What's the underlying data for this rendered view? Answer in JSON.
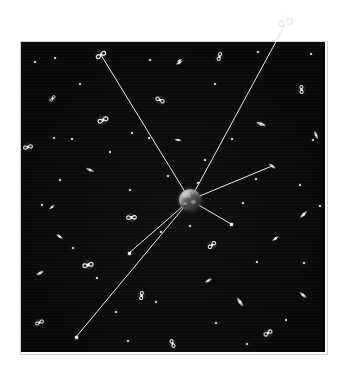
{
  "figure": {
    "title": "",
    "domain": "astronomy-diagram",
    "canvas": {
      "width": 341,
      "height": 367,
      "background": "#ffffff"
    },
    "field": {
      "x": 21,
      "y": 42,
      "width": 304,
      "height": 310,
      "fill": "#090909",
      "border_color": "#d2d2d2"
    }
  },
  "colors": {
    "background": "#ffffff",
    "space": "#090909",
    "sightline": "#e8e8e8",
    "star": "#f2f2f2",
    "galaxy": "#ededed",
    "node": "#fafafa",
    "planet_light": "#c9c9c9",
    "planet_dark": "#171717"
  },
  "observer": {
    "name": "central-planet",
    "cx": 190,
    "cy": 200,
    "diameter": 22
  },
  "sightlines": [
    {
      "name": "sightline-upper-left",
      "x1": 190,
      "y1": 200,
      "x2": 101,
      "y2": 55
    },
    {
      "name": "sightline-upper-right-outer",
      "x1": 190,
      "y1": 200,
      "x2": 285,
      "y2": 25
    },
    {
      "name": "sightline-right",
      "x1": 190,
      "y1": 200,
      "x2": 272,
      "y2": 166
    },
    {
      "name": "sightline-lower-right",
      "x1": 190,
      "y1": 200,
      "x2": 231,
      "y2": 224
    },
    {
      "name": "sightline-lower-left-short",
      "x1": 190,
      "y1": 200,
      "x2": 129,
      "y2": 253
    },
    {
      "name": "sightline-lower-left-long",
      "x1": 190,
      "y1": 200,
      "x2": 76,
      "y2": 337
    }
  ],
  "target_nodes": [
    {
      "name": "node-lower-right",
      "x": 231,
      "y": 224,
      "size": 3
    },
    {
      "name": "node-lower-left-short",
      "x": 129,
      "y": 253,
      "size": 3
    },
    {
      "name": "node-lower-left-long",
      "x": 76,
      "y": 337,
      "size": 3
    }
  ],
  "galaxies": [
    {
      "name": "galaxy-outside-frame-top-right",
      "x": 285,
      "y": 22,
      "size": 19,
      "type": "spiral",
      "rot": 20,
      "outside_field": true
    },
    {
      "name": "galaxy-sightline-upper-left",
      "x": 101,
      "y": 55,
      "size": 14,
      "type": "spiral",
      "rot": 0
    },
    {
      "name": "galaxy-sightline-right",
      "x": 272,
      "y": 166,
      "size": 10,
      "type": "edge-on",
      "rot": 35
    },
    {
      "name": "galaxy-ul-small",
      "x": 52,
      "y": 98,
      "size": 9,
      "type": "spiral",
      "rot": 160
    },
    {
      "name": "galaxy-ul-mid",
      "x": 103,
      "y": 120,
      "size": 14,
      "type": "spiral",
      "rot": 10
    },
    {
      "name": "galaxy-left-edge",
      "x": 28,
      "y": 147,
      "size": 12,
      "type": "spiral",
      "rot": 200
    },
    {
      "name": "galaxy-ul-edgeon",
      "x": 90,
      "y": 170,
      "size": 10,
      "type": "edge-on",
      "rot": 25
    },
    {
      "name": "galaxy-top-mid",
      "x": 219,
      "y": 56,
      "size": 11,
      "type": "spiral",
      "rot": 140
    },
    {
      "name": "galaxy-top-left-edgeon",
      "x": 179,
      "y": 62,
      "size": 9,
      "type": "edge-on",
      "rot": 150
    },
    {
      "name": "galaxy-mid-top",
      "x": 160,
      "y": 100,
      "size": 12,
      "type": "spiral",
      "rot": 60
    },
    {
      "name": "galaxy-ur-spiral",
      "x": 301,
      "y": 89,
      "size": 11,
      "type": "spiral",
      "rot": 120
    },
    {
      "name": "galaxy-ur-edgeon",
      "x": 261,
      "y": 124,
      "size": 12,
      "type": "edge-on",
      "rot": 20
    },
    {
      "name": "galaxy-r-edgeon",
      "x": 316,
      "y": 135,
      "size": 10,
      "type": "edge-on",
      "rot": 65
    },
    {
      "name": "galaxy-l-edgeon-2",
      "x": 178,
      "y": 140,
      "size": 8,
      "type": "edge-on",
      "rot": 10
    },
    {
      "name": "galaxy-ll-spiral",
      "x": 131,
      "y": 217,
      "size": 13,
      "type": "spiral",
      "rot": 30
    },
    {
      "name": "galaxy-l-edgeon-3",
      "x": 40,
      "y": 273,
      "size": 10,
      "type": "edge-on",
      "rot": 150
    },
    {
      "name": "galaxy-ll-big",
      "x": 88,
      "y": 265,
      "size": 14,
      "type": "spiral",
      "rot": 200
    },
    {
      "name": "galaxy-bl-corner",
      "x": 39,
      "y": 322,
      "size": 11,
      "type": "spiral",
      "rot": 10
    },
    {
      "name": "galaxy-bm-spiral",
      "x": 141,
      "y": 295,
      "size": 11,
      "type": "spiral",
      "rot": 130
    },
    {
      "name": "galaxy-b-edgeon",
      "x": 240,
      "y": 302,
      "size": 12,
      "type": "edge-on",
      "rot": 55
    },
    {
      "name": "galaxy-lr-spiral",
      "x": 212,
      "y": 245,
      "size": 12,
      "type": "spiral",
      "rot": 170
    },
    {
      "name": "galaxy-lr-edgeon",
      "x": 303,
      "y": 214,
      "size": 11,
      "type": "edge-on",
      "rot": 135
    },
    {
      "name": "galaxy-r-edgeon-4",
      "x": 275,
      "y": 238,
      "size": 9,
      "type": "edge-on",
      "rot": 145
    },
    {
      "name": "galaxy-r-edgeon-5",
      "x": 303,
      "y": 295,
      "size": 10,
      "type": "edge-on",
      "rot": 40
    },
    {
      "name": "galaxy-b-spiral",
      "x": 268,
      "y": 333,
      "size": 12,
      "type": "spiral",
      "rot": 0
    },
    {
      "name": "galaxy-bm-2",
      "x": 172,
      "y": 343,
      "size": 11,
      "type": "spiral",
      "rot": 100
    },
    {
      "name": "galaxy-l-edgeon-6",
      "x": 59,
      "y": 236,
      "size": 9,
      "type": "edge-on",
      "rot": 35
    },
    {
      "name": "galaxy-ll-edgeon-7",
      "x": 52,
      "y": 207,
      "size": 8,
      "type": "edge-on",
      "rot": 140
    },
    {
      "name": "galaxy-r-edgeon-8",
      "x": 208,
      "y": 280,
      "size": 9,
      "type": "edge-on",
      "rot": 150
    },
    {
      "name": "galaxy-ur-edgeon-9",
      "x": 179,
      "y": 60,
      "size": 7,
      "type": "edge-on",
      "rot": 150
    }
  ],
  "stars": [
    {
      "x": 55,
      "y": 58,
      "r": 1.4
    },
    {
      "x": 150,
      "y": 60,
      "r": 1.0
    },
    {
      "x": 258,
      "y": 52,
      "r": 1.0
    },
    {
      "x": 311,
      "y": 54,
      "r": 1.1
    },
    {
      "x": 80,
      "y": 84,
      "r": 1.3
    },
    {
      "x": 215,
      "y": 84,
      "r": 1.2
    },
    {
      "x": 132,
      "y": 133,
      "r": 1.4
    },
    {
      "x": 149,
      "y": 138,
      "r": 1.0
    },
    {
      "x": 54,
      "y": 138,
      "r": 1.2
    },
    {
      "x": 72,
      "y": 139,
      "r": 1.1
    },
    {
      "x": 232,
      "y": 139,
      "r": 1.0
    },
    {
      "x": 313,
      "y": 140,
      "r": 1.2
    },
    {
      "x": 198,
      "y": 183,
      "r": 1.1
    },
    {
      "x": 256,
      "y": 179,
      "r": 1.1
    },
    {
      "x": 42,
      "y": 205,
      "r": 1.2
    },
    {
      "x": 130,
      "y": 190,
      "r": 1.2
    },
    {
      "x": 243,
      "y": 203,
      "r": 1.0
    },
    {
      "x": 320,
      "y": 206,
      "r": 1.1
    },
    {
      "x": 73,
      "y": 248,
      "r": 1.1
    },
    {
      "x": 161,
      "y": 232,
      "r": 1.0
    },
    {
      "x": 190,
      "y": 226,
      "r": 1.0
    },
    {
      "x": 257,
      "y": 262,
      "r": 1.2
    },
    {
      "x": 304,
      "y": 263,
      "r": 1.0
    },
    {
      "x": 97,
      "y": 278,
      "r": 1.0
    },
    {
      "x": 156,
      "y": 302,
      "r": 1.1
    },
    {
      "x": 116,
      "y": 312,
      "r": 1.2
    },
    {
      "x": 216,
      "y": 323,
      "r": 1.1
    },
    {
      "x": 286,
      "y": 320,
      "r": 1.2
    },
    {
      "x": 128,
      "y": 341,
      "r": 1.3
    },
    {
      "x": 247,
      "y": 344,
      "r": 1.0
    },
    {
      "x": 35,
      "y": 62,
      "r": 1.1
    },
    {
      "x": 300,
      "y": 185,
      "r": 1.0
    },
    {
      "x": 60,
      "y": 180,
      "r": 1.0
    },
    {
      "x": 205,
      "y": 160,
      "r": 0.9
    },
    {
      "x": 168,
      "y": 176,
      "r": 0.9
    },
    {
      "x": 110,
      "y": 152,
      "r": 0.9
    }
  ]
}
